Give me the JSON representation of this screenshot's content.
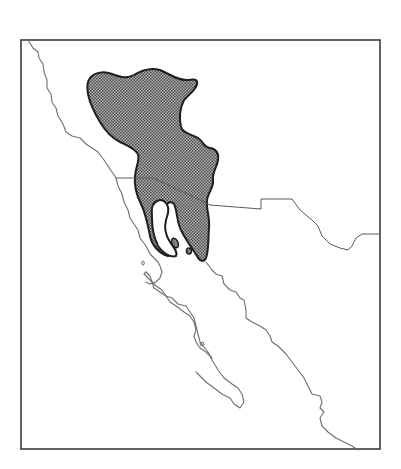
{
  "map": {
    "type": "species range map",
    "region": "Southwestern United States and northwestern Mexico (Baja California, Sonora)",
    "frame": {
      "x": 21,
      "y": 40,
      "width": 359,
      "height": 409
    },
    "colors": {
      "background": "#ffffff",
      "frame": "#3a3a3a",
      "coastline": "#6e6e6e",
      "political_border": "#5a5a5a",
      "range_fill": "#8a8a8a",
      "range_outline": "#1e1e1e"
    },
    "layers": [
      {
        "name": "coastline",
        "style": "thin gray line"
      },
      {
        "name": "international-border",
        "style": "thin gray line"
      },
      {
        "name": "distribution-range",
        "style": "stippled gray fill with bold black outline"
      }
    ],
    "labels": []
  }
}
